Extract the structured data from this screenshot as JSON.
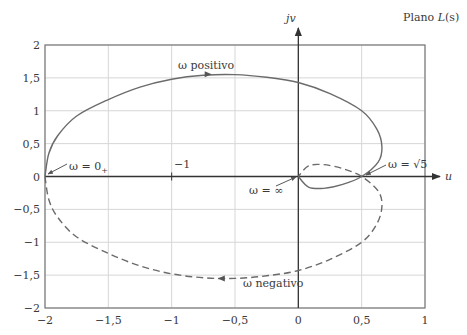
{
  "chart_data": {
    "type": "line",
    "title": "Plano L(s)",
    "xlabel": "u",
    "ylabel": "jv",
    "xlim": [
      -2,
      1
    ],
    "ylim": [
      -2,
      2
    ],
    "grid": true,
    "x_ticks": [
      -2,
      -1.5,
      -1,
      -0.5,
      0,
      0.5,
      1
    ],
    "x_tick_labels": [
      "−2",
      "−1,5",
      "−1",
      "−0,5",
      "0",
      "0,5",
      "1"
    ],
    "y_ticks": [
      2,
      1.5,
      1,
      0.5,
      0,
      -0.5,
      -1,
      -1.5,
      -2
    ],
    "y_tick_labels": [
      "2",
      "1,5",
      "1",
      "0,5",
      "0",
      "−0,5",
      "−1",
      "−1,5",
      "−2"
    ],
    "series": [
      {
        "name": "ω positivo",
        "style": "solid",
        "color": "#6b6b6b",
        "points": [
          [
            -2,
            0
          ],
          [
            -1.97,
            0.35
          ],
          [
            -1.9,
            0.62
          ],
          [
            -1.75,
            0.92
          ],
          [
            -1.5,
            1.17
          ],
          [
            -1.25,
            1.36
          ],
          [
            -1,
            1.48
          ],
          [
            -0.75,
            1.54
          ],
          [
            -0.5,
            1.55
          ],
          [
            -0.25,
            1.51
          ],
          [
            0,
            1.43
          ],
          [
            0.25,
            1.26
          ],
          [
            0.5,
            1.0
          ],
          [
            0.62,
            0.72
          ],
          [
            0.66,
            0.45
          ],
          [
            0.63,
            0.22
          ],
          [
            0.5,
            0
          ],
          [
            0.35,
            -0.12
          ],
          [
            0.2,
            -0.18
          ],
          [
            0.08,
            -0.16
          ],
          [
            0,
            0
          ]
        ]
      },
      {
        "name": "ω negativo",
        "style": "dashed",
        "color": "#6b6b6b",
        "points": [
          [
            -2,
            0
          ],
          [
            -1.97,
            -0.35
          ],
          [
            -1.9,
            -0.62
          ],
          [
            -1.75,
            -0.92
          ],
          [
            -1.5,
            -1.17
          ],
          [
            -1.25,
            -1.36
          ],
          [
            -1,
            -1.48
          ],
          [
            -0.75,
            -1.54
          ],
          [
            -0.5,
            -1.55
          ],
          [
            -0.25,
            -1.51
          ],
          [
            0,
            -1.43
          ],
          [
            0.25,
            -1.26
          ],
          [
            0.5,
            -1.0
          ],
          [
            0.62,
            -0.72
          ],
          [
            0.66,
            -0.45
          ],
          [
            0.63,
            -0.22
          ],
          [
            0.5,
            0
          ],
          [
            0.35,
            0.12
          ],
          [
            0.2,
            0.18
          ],
          [
            0.08,
            0.16
          ],
          [
            0,
            0
          ]
        ]
      }
    ],
    "annotations": [
      {
        "text": "ω positivo",
        "x": -0.97,
        "y": 1.66
      },
      {
        "text": "ω negativo",
        "x": -0.55,
        "y": -1.78
      },
      {
        "text": "ω = 0+",
        "x": -1.72,
        "y": 0.12
      },
      {
        "text": "ω = ∞",
        "x": -0.48,
        "y": -0.3
      },
      {
        "text": "ω = √5",
        "x": 0.68,
        "y": 0.1
      },
      {
        "text": "−1",
        "x": -0.97,
        "y": 0.12
      }
    ]
  },
  "labels": {
    "plane": "Plano ",
    "plane_fn": "L",
    "plane_arg": "(s)",
    "u_axis": "u",
    "v_axis": "jv",
    "omega_pos": "ω positivo",
    "omega_neg": "ω negativo",
    "omega_zero": "ω = 0",
    "omega_zero_sub": "+",
    "omega_inf": "ω = ∞",
    "omega_sqrt": "ω = √5",
    "minus_one": "−1"
  }
}
